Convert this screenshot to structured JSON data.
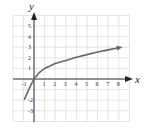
{
  "chart_data": {
    "type": "line",
    "title": "",
    "xlabel": "x",
    "ylabel": "y",
    "xlim": [
      -2,
      9
    ],
    "ylim": [
      -4,
      6
    ],
    "grid": true,
    "x_ticks": [
      "-1",
      "1",
      "2",
      "3",
      "4",
      "5",
      "6",
      "7",
      "8"
    ],
    "y_ticks": [
      "5",
      "4",
      "3",
      "2",
      "1",
      "-2",
      "-3"
    ],
    "series": [
      {
        "name": "curve",
        "color": "#666666",
        "arrow_at_end": true,
        "x": [
          -0.9,
          -0.5,
          0,
          0.5,
          1,
          2,
          3,
          4,
          5,
          6,
          7,
          8
        ],
        "y": [
          -1.9,
          -1.0,
          0,
          0.6,
          1.0,
          1.45,
          1.75,
          2.05,
          2.3,
          2.55,
          2.75,
          2.95
        ]
      }
    ]
  }
}
